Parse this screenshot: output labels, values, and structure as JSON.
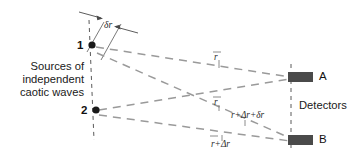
{
  "figure": {
    "caption_left": {
      "line1": "Sources of",
      "line2": "independent",
      "line3": "caotic waves"
    },
    "detectors_label": "Detectors",
    "sources": [
      {
        "id": "1",
        "label": "1",
        "x": 88,
        "y": 45
      },
      {
        "id": "2",
        "label": "2",
        "x": 92,
        "y": 110
      }
    ],
    "detectors": [
      {
        "id": "A",
        "label": "A",
        "x": 296,
        "y": 77
      },
      {
        "id": "B",
        "label": "B",
        "x": 296,
        "y": 140
      }
    ],
    "separation_label": {
      "text": "δr",
      "symbol": "δ",
      "variable": "r"
    },
    "path_labels": [
      {
        "id": "path-1-to-A",
        "text": "r",
        "x": 216,
        "y": 52
      },
      {
        "id": "path-2-to-A",
        "text": "r",
        "x": 216,
        "y": 97
      },
      {
        "id": "path-1-to-B",
        "text": "r+Δr+δr",
        "x": 233,
        "y": 110
      },
      {
        "id": "path-2-to-B",
        "text": "r+Δr",
        "x": 213,
        "y": 139
      }
    ],
    "colors": {
      "ray": "#9a9a9a",
      "axis_dash": "#5a5a5a",
      "detector_fill": "#4a4a4a",
      "source_dot": "#1a1a1a",
      "text": "#1c1c1c"
    }
  }
}
